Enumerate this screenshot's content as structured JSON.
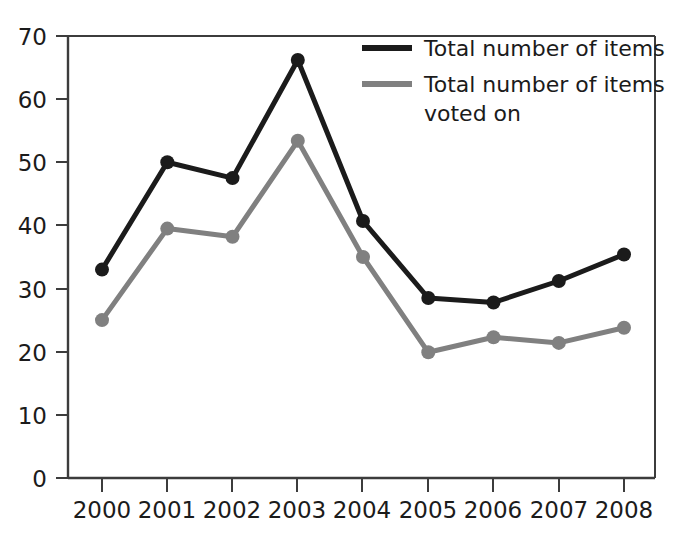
{
  "chart_data": {
    "type": "line",
    "title": "",
    "xlabel": "",
    "ylabel": "",
    "categories": [
      "2000",
      "2001",
      "2002",
      "2003",
      "2004",
      "2005",
      "2006",
      "2007",
      "2008"
    ],
    "x": [
      2000,
      2001,
      2002,
      2003,
      2004,
      2005,
      2006,
      2007,
      2008
    ],
    "xlim": [
      2000,
      2008
    ],
    "ylim": [
      0,
      70
    ],
    "yticks": [
      0,
      10,
      20,
      30,
      40,
      50,
      60,
      70
    ],
    "ytick_labels": [
      "0",
      "10",
      "20",
      "30",
      "40",
      "50",
      "60",
      "70"
    ],
    "grid": false,
    "legend_position": "top-right",
    "series": [
      {
        "name": "Total number of items",
        "color": "#1b1b1b",
        "marker": "circle",
        "values": [
          33,
          50,
          47.5,
          66.2,
          40.7,
          28.5,
          27.8,
          31.2,
          35.4
        ]
      },
      {
        "name": "Total number of items voted on",
        "color": "#808080",
        "marker": "circle",
        "values": [
          25,
          39.5,
          38.2,
          53.4,
          35,
          19.9,
          22.3,
          21.4,
          23.8
        ]
      }
    ]
  },
  "legend": {
    "entries": [
      {
        "label_line1": "Total number of items",
        "label_line2": ""
      },
      {
        "label_line1": "Total number of items",
        "label_line2": "voted on"
      }
    ]
  },
  "axes": {
    "y_tick_labels": [
      "70",
      "60",
      "50",
      "40",
      "30",
      "20",
      "10",
      "0"
    ],
    "x_tick_labels": [
      "2000",
      "2001",
      "2002",
      "2003",
      "2004",
      "2005",
      "2006",
      "2007",
      "2008"
    ]
  },
  "colors": {
    "series_primary": "#1b1b1b",
    "series_secondary": "#808080",
    "axis": "#3c3c3c",
    "background": "#ffffff"
  }
}
